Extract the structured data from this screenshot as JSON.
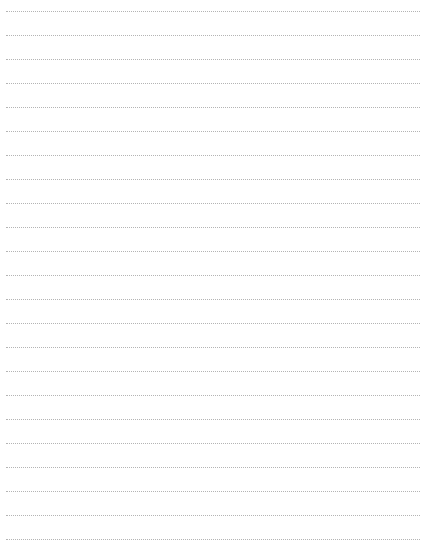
{
  "page": {
    "type": "blank lined writing paper",
    "line_style": "dotted",
    "line_color": "#b4b4b4",
    "background_color": "#ffffff",
    "line_count": 23,
    "first_line_y": 11,
    "line_spacing": 24,
    "line_left": 6,
    "line_width": 414
  }
}
